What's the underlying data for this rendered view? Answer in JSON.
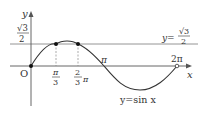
{
  "diagram": {
    "curve_label": "y=sin x",
    "line_label_lhs": "y=",
    "line_label_num": "√3",
    "line_label_den": "2",
    "y_axis_label": "y",
    "x_axis_label": "x",
    "origin_label": "O",
    "ytick_num": "√3",
    "ytick_den": "2",
    "xticks": {
      "pi_over_3_num": "π",
      "pi_over_3_den": "3",
      "two_thirds_num": "2",
      "two_thirds_den": "3",
      "two_thirds_pi": "π",
      "pi": "π",
      "two_pi": "2π"
    },
    "colors": {
      "curve": "#333333",
      "axes": "#555555",
      "line": "#777777"
    }
  }
}
